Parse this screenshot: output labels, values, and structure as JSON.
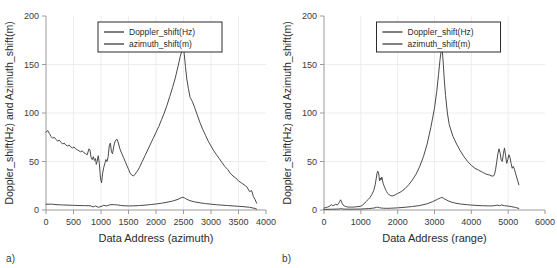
{
  "figure": {
    "panels": [
      {
        "id": "a",
        "sublabel": "a)",
        "chart_data": {
          "type": "line",
          "title": "",
          "xlabel": "Data Address (azimuth)",
          "ylabel": "Doppler_shift(Hz) and Azimuth_shift(m)",
          "xlim": [
            0,
            4000
          ],
          "ylim": [
            0,
            200
          ],
          "xticks": [
            0,
            500,
            1000,
            1500,
            2000,
            2500,
            3000,
            3500,
            4000
          ],
          "yticks": [
            0,
            50,
            100,
            150,
            200
          ],
          "grid": true,
          "legend_position": "top-center",
          "legend": [
            "Doppler_shift(Hz)",
            "azimuth_shift(m)"
          ],
          "series": [
            {
              "name": "Doppler_shift(Hz)",
              "color": "#4a4a4a",
              "x": [
                0,
                30,
                60,
                90,
                120,
                150,
                180,
                210,
                240,
                270,
                300,
                330,
                360,
                390,
                420,
                450,
                480,
                510,
                540,
                570,
                600,
                630,
                660,
                690,
                720,
                750,
                780,
                800,
                820,
                840,
                860,
                880,
                900,
                915,
                930,
                950,
                970,
                990,
                1010,
                1030,
                1050,
                1070,
                1090,
                1110,
                1130,
                1150,
                1170,
                1190,
                1210,
                1230,
                1250,
                1270,
                1290,
                1310,
                1330,
                1350,
                1380,
                1410,
                1440,
                1470,
                1500,
                1530,
                1560,
                1590,
                1620,
                1660,
                1700,
                1750,
                1800,
                1850,
                1900,
                1950,
                2000,
                2050,
                2100,
                2150,
                2200,
                2250,
                2300,
                2350,
                2400,
                2440,
                2470,
                2490,
                2500,
                2515,
                2535,
                2560,
                2590,
                2620,
                2660,
                2700,
                2750,
                2800,
                2850,
                2900,
                2950,
                3000,
                3050,
                3100,
                3150,
                3200,
                3250,
                3300,
                3350,
                3400,
                3450,
                3500,
                3550,
                3600,
                3650,
                3700,
                3740,
                3770,
                3800,
                3830
              ],
              "y": [
                80,
                82,
                79,
                76,
                74,
                75,
                73,
                71,
                72,
                70,
                68,
                69,
                67,
                66,
                67,
                65,
                64,
                65,
                63,
                62,
                61,
                60,
                61,
                59,
                58,
                57,
                63,
                62,
                54,
                52,
                55,
                51,
                53,
                47,
                50,
                56,
                48,
                33,
                28,
                38,
                44,
                48,
                52,
                50,
                55,
                66,
                69,
                60,
                58,
                65,
                70,
                72,
                73,
                70,
                66,
                62,
                58,
                54,
                50,
                46,
                42,
                38,
                36,
                35,
                37,
                40,
                44,
                50,
                56,
                62,
                68,
                74,
                80,
                86,
                93,
                100,
                108,
                117,
                126,
                136,
                148,
                158,
                164,
                166,
                167,
                160,
                148,
                135,
                125,
                116,
                112,
                106,
                98,
                90,
                83,
                77,
                71,
                66,
                61,
                57,
                53,
                49,
                45,
                42,
                38,
                35,
                33,
                30,
                28,
                26,
                24,
                19,
                20,
                14,
                11,
                7,
                5
              ]
            },
            {
              "name": "azimuth_shift(m)",
              "color": "#4a4a4a",
              "x": [
                0,
                100,
                200,
                300,
                400,
                500,
                600,
                700,
                800,
                860,
                900,
                950,
                1000,
                1050,
                1100,
                1150,
                1200,
                1250,
                1300,
                1350,
                1400,
                1500,
                1600,
                1700,
                1800,
                1900,
                2000,
                2100,
                2200,
                2300,
                2400,
                2450,
                2490,
                2520,
                2560,
                2620,
                2700,
                2800,
                2900,
                3000,
                3100,
                3200,
                3300,
                3400,
                3500,
                3600,
                3700,
                3800,
                3830
              ],
              "y": [
                6,
                6,
                5.5,
                5.2,
                5,
                4.8,
                4.6,
                4.5,
                4.4,
                3.2,
                4.2,
                2.8,
                3.6,
                4.8,
                4.2,
                5.2,
                5.6,
                5.4,
                5.2,
                4.8,
                4.4,
                4.2,
                4.3,
                4.6,
                5,
                5.6,
                6.2,
                7,
                8,
                9.2,
                11,
                12.4,
                13.2,
                12.4,
                11,
                9.6,
                8.4,
                7.4,
                6.6,
                6,
                5.4,
                5,
                4.6,
                4.2,
                3.8,
                3.4,
                2.8,
                1.6,
                0.8
              ]
            }
          ]
        }
      },
      {
        "id": "b",
        "sublabel": "b)",
        "chart_data": {
          "type": "line",
          "title": "",
          "xlabel": "Data Address (range)",
          "ylabel": "Doppler_shift(Hz) and Azimuth_shift(m)",
          "xlim": [
            0,
            6000
          ],
          "ylim": [
            0,
            200
          ],
          "xticks": [
            0,
            1000,
            2000,
            3000,
            4000,
            5000,
            6000
          ],
          "yticks": [
            0,
            50,
            100,
            150,
            200
          ],
          "grid": true,
          "legend_position": "top-center",
          "legend": [
            "Doppler_shift(Hz)",
            "azimuth_shift(m)"
          ],
          "series": [
            {
              "name": "Doppler_shift(Hz)",
              "color": "#4a4a4a",
              "x": [
                0,
                50,
                100,
                150,
                200,
                240,
                280,
                320,
                360,
                400,
                430,
                450,
                470,
                490,
                520,
                560,
                600,
                650,
                700,
                750,
                800,
                850,
                900,
                950,
                1000,
                1050,
                1100,
                1150,
                1200,
                1250,
                1300,
                1350,
                1390,
                1420,
                1440,
                1460,
                1475,
                1490,
                1510,
                1530,
                1550,
                1570,
                1590,
                1610,
                1630,
                1650,
                1670,
                1700,
                1730,
                1760,
                1800,
                1850,
                1900,
                1950,
                2000,
                2100,
                2200,
                2300,
                2400,
                2500,
                2600,
                2700,
                2800,
                2900,
                3000,
                3060,
                3110,
                3150,
                3180,
                3200,
                3215,
                3240,
                3270,
                3300,
                3350,
                3400,
                3500,
                3600,
                3700,
                3800,
                3900,
                4000,
                4100,
                4200,
                4300,
                4400,
                4500,
                4560,
                4600,
                4630,
                4660,
                4690,
                4720,
                4750,
                4780,
                4810,
                4840,
                4870,
                4900,
                4930,
                4960,
                4990,
                5020,
                5050,
                5080,
                5110,
                5140,
                5170,
                5200,
                5230,
                5260,
                5290
              ],
              "y": [
                2,
                2.5,
                3,
                4,
                5.5,
                4.5,
                5,
                6,
                5,
                7,
                9,
                10.5,
                9,
                7,
                5,
                4,
                3.5,
                3,
                3,
                3,
                3,
                3.2,
                3.4,
                3.6,
                4,
                5,
                7,
                9,
                11,
                13,
                16,
                20,
                26,
                33,
                38,
                40,
                39,
                36,
                30,
                33,
                31,
                34,
                30,
                27,
                25,
                23,
                21,
                19,
                17,
                16,
                15,
                14.5,
                15,
                16,
                17,
                19,
                22,
                26,
                31,
                37,
                45,
                55,
                68,
                85,
                105,
                122,
                140,
                155,
                164,
                167,
                163,
                150,
                132,
                118,
                100,
                88,
                76,
                68,
                61,
                55,
                50,
                46,
                43,
                41,
                39,
                37,
                36,
                35,
                35,
                37,
                42,
                50,
                58,
                63,
                59,
                52,
                50,
                58,
                64,
                56,
                48,
                52,
                57,
                54,
                48,
                43,
                45,
                42,
                38,
                34,
                30,
                26,
                22
              ]
            },
            {
              "name": "azimuth_shift(m)",
              "color": "#4a4a4a",
              "x": [
                0,
                200,
                400,
                450,
                500,
                600,
                800,
                1000,
                1200,
                1350,
                1420,
                1460,
                1500,
                1560,
                1620,
                1700,
                1800,
                1900,
                2000,
                2200,
                2400,
                2600,
                2800,
                2950,
                3080,
                3160,
                3200,
                3240,
                3320,
                3420,
                3550,
                3700,
                3900,
                4100,
                4300,
                4500,
                4620,
                4700,
                4760,
                4820,
                4900,
                5000,
                5100,
                5200,
                5290
              ],
              "y": [
                0.6,
                0.8,
                1,
                1.4,
                1.1,
                0.9,
                0.9,
                1,
                1.4,
                2,
                2.6,
                3,
                2.4,
                2,
                1.8,
                1.7,
                1.8,
                2,
                2.2,
                2.8,
                3.6,
                4.6,
                6.4,
                8.6,
                11,
                12.4,
                13,
                12.2,
                10.4,
                8.6,
                7.2,
                6.2,
                5.4,
                4.8,
                4.4,
                4.2,
                4.4,
                5,
                4.4,
                5.2,
                4.4,
                4,
                3.4,
                2.6,
                1.6
              ]
            }
          ]
        }
      }
    ]
  }
}
